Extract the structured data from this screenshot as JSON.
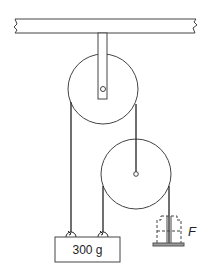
{
  "diagram": {
    "type": "pulley-system",
    "ceiling": {
      "label": ""
    },
    "fixed_pulley": {
      "name": "upper fixed pulley"
    },
    "movable_pulley": {
      "name": "lower movable pulley"
    },
    "mass": {
      "label": "300 g"
    },
    "force": {
      "label": "F"
    },
    "hanger": {
      "name": "slotted weight hanger"
    },
    "colors": {
      "line": "#333333",
      "background": "#ffffff",
      "plate": "#888888"
    }
  }
}
